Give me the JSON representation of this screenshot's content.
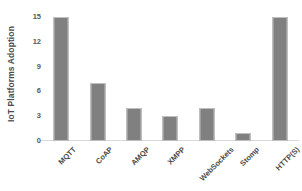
{
  "chart_data": {
    "type": "bar",
    "title": "",
    "xlabel": "",
    "ylabel": "IoT Platforms Adoption",
    "categories": [
      "MQTT",
      "CoAP",
      "AMQP",
      "XMPP",
      "WebSockets",
      "Stomp",
      "HTTP(S)"
    ],
    "values": [
      15,
      7,
      4,
      3,
      4,
      1,
      15
    ],
    "ylim": [
      0,
      15
    ],
    "yticks": [
      0,
      3,
      6,
      9,
      12,
      15
    ],
    "ytick_labels": [
      "0",
      "3",
      "6",
      "9",
      "12",
      "15"
    ],
    "grid": false,
    "legend": false,
    "bar_color": "#808080",
    "bar_edge_color": "#bfbfbf",
    "axis_color": "#d9d9d9",
    "text_color": "#4a4a4a",
    "background": "#ffffff"
  }
}
